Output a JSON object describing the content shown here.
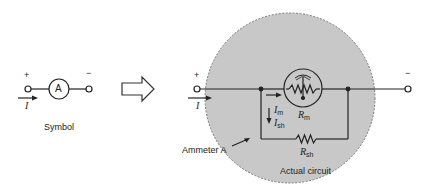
{
  "symbol": {
    "meter_letter": "A",
    "plus": "+",
    "minus": "−",
    "current": "I",
    "caption": "Symbol"
  },
  "arrow": {
    "icon": "hollow-right-arrow-icon"
  },
  "actual": {
    "plus": "+",
    "minus": "−",
    "current": "I",
    "im_main": "I",
    "im_sub": "m",
    "ish_main": "I",
    "ish_sub": "sh",
    "rm_main": "R",
    "rm_sub": "m",
    "rsh_main": "R",
    "rsh_sub": "sh",
    "ammeter_label": "Ammeter A",
    "caption": "Actual circuit"
  },
  "colors": {
    "circle_fill": "#c8c8c8",
    "line": "#222222"
  }
}
